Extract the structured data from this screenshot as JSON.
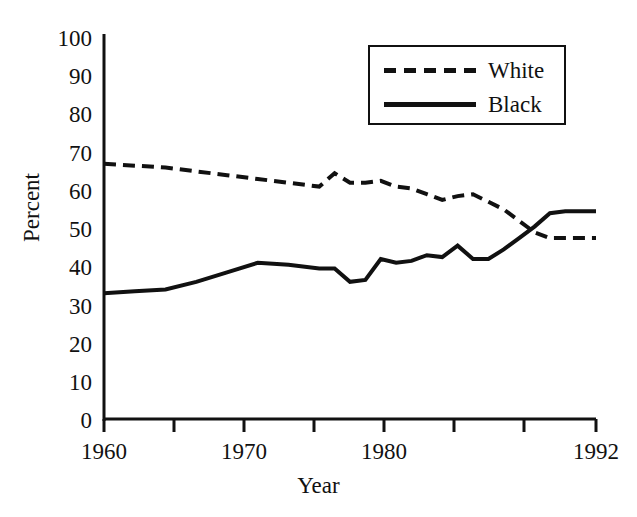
{
  "chart_data": {
    "type": "line",
    "title": "",
    "xlabel": "Year",
    "ylabel": "Percent",
    "xlim": [
      1960,
      1992
    ],
    "ylim": [
      0,
      100
    ],
    "grid": false,
    "legend_position": "top-right",
    "x_ticks_major": [
      1960,
      1970,
      1980,
      1992
    ],
    "x_ticks_minor": [
      1965,
      1975,
      1985,
      1990
    ],
    "y_ticks": [
      0,
      10,
      20,
      30,
      40,
      50,
      60,
      70,
      80,
      90,
      100
    ],
    "x": [
      1960,
      1962,
      1964,
      1966,
      1968,
      1970,
      1972,
      1974,
      1975,
      1976,
      1977,
      1978,
      1979,
      1980,
      1981,
      1982,
      1983,
      1984,
      1985,
      1986,
      1987,
      1988,
      1989,
      1990,
      1992
    ],
    "series": [
      {
        "name": "White",
        "style": "dashed",
        "color": "#111111",
        "values": [
          67,
          66.5,
          66,
          65,
          64,
          63,
          62,
          61,
          64.5,
          62,
          62,
          62.5,
          61,
          60.5,
          59,
          57.5,
          58.5,
          59,
          57,
          55,
          52,
          49,
          47.5,
          47.5,
          47.5
        ]
      },
      {
        "name": "Black",
        "style": "solid",
        "color": "#111111",
        "values": [
          33,
          33.5,
          34,
          36,
          38.5,
          41,
          40.5,
          39.5,
          39.5,
          36,
          36.5,
          42,
          41,
          41.5,
          43,
          42.5,
          45.5,
          42,
          42,
          44.5,
          47.5,
          50.5,
          54,
          54.5,
          54.5
        ]
      }
    ],
    "legend": [
      {
        "label": "White",
        "style": "dashed"
      },
      {
        "label": "Black",
        "style": "solid"
      }
    ]
  },
  "axes": {
    "y_tick_labels": [
      "100",
      "90",
      "80",
      "70",
      "60",
      "50",
      "40",
      "30",
      "20",
      "10",
      "0"
    ],
    "x_tick_labels": [
      "1960",
      "1970",
      "1980",
      "1992"
    ],
    "y_title": "Percent",
    "x_title": "Year"
  }
}
